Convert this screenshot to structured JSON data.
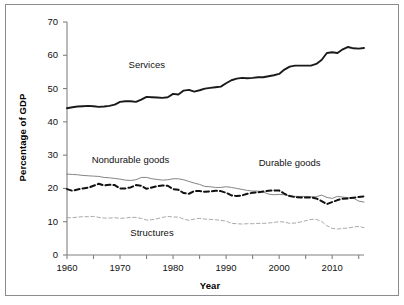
{
  "chart_data": {
    "type": "line",
    "title": "",
    "xlabel": "Year",
    "ylabel": "Percentage of GDP",
    "xlim": [
      1960,
      2016
    ],
    "ylim": [
      0,
      70
    ],
    "grid": false,
    "legend_position": "inline-annotations",
    "yticks": [
      0,
      10,
      20,
      30,
      40,
      50,
      60,
      70
    ],
    "ytick_labels": [
      "0",
      "10",
      "20",
      "30",
      "40",
      "50",
      "60",
      "70"
    ],
    "xticks": [
      1960,
      1965,
      1970,
      1975,
      1980,
      1985,
      1990,
      1995,
      2000,
      2005,
      2010,
      2015
    ],
    "xtick_labels_major": [
      "1960",
      "1970",
      "1980",
      "1990",
      "2000",
      "2010"
    ],
    "xtick_major_values": [
      1960,
      1970,
      1980,
      1990,
      2000,
      2010
    ],
    "x": [
      1960,
      1961,
      1962,
      1963,
      1964,
      1965,
      1966,
      1967,
      1968,
      1969,
      1970,
      1971,
      1972,
      1973,
      1974,
      1975,
      1976,
      1977,
      1978,
      1979,
      1980,
      1981,
      1982,
      1983,
      1984,
      1985,
      1986,
      1987,
      1988,
      1989,
      1990,
      1991,
      1992,
      1993,
      1994,
      1995,
      1996,
      1997,
      1998,
      1999,
      2000,
      2001,
      2002,
      2003,
      2004,
      2005,
      2006,
      2007,
      2008,
      2009,
      2010,
      2011,
      2012,
      2013,
      2014,
      2015,
      2016
    ],
    "series": [
      {
        "name": "Services",
        "style": "solid-thick",
        "color": "#1a1a1a",
        "label_x": 1975,
        "label_y": 57,
        "values": [
          44.1,
          44.4,
          44.6,
          44.7,
          44.8,
          44.7,
          44.5,
          44.6,
          44.8,
          45.2,
          46.0,
          46.2,
          46.2,
          46.0,
          46.7,
          47.5,
          47.4,
          47.3,
          47.2,
          47.4,
          48.4,
          48.2,
          49.4,
          49.6,
          49.1,
          49.5,
          50.0,
          50.2,
          50.4,
          50.6,
          51.6,
          52.5,
          53.0,
          53.2,
          53.1,
          53.2,
          53.4,
          53.4,
          53.7,
          54.0,
          54.4,
          55.7,
          56.6,
          56.9,
          56.9,
          56.9,
          56.9,
          57.4,
          58.6,
          60.7,
          60.9,
          60.7,
          61.8,
          62.5,
          62.1,
          62.0,
          62.2
        ]
      },
      {
        "name": "Nondurable goods",
        "style": "solid-thin",
        "color": "#6e6e6e",
        "label_x": 1972,
        "label_y": 28.5,
        "values": [
          24.3,
          24.2,
          24.1,
          23.9,
          23.8,
          23.7,
          23.6,
          23.3,
          23.2,
          23.0,
          22.8,
          22.5,
          22.4,
          22.6,
          23.3,
          23.3,
          22.9,
          22.7,
          22.5,
          22.6,
          22.9,
          22.9,
          22.6,
          22.1,
          21.6,
          21.2,
          20.6,
          20.5,
          20.3,
          20.3,
          20.5,
          20.3,
          20.0,
          19.7,
          19.4,
          19.2,
          19.2,
          18.9,
          18.3,
          18.1,
          18.2,
          18.1,
          17.7,
          17.6,
          17.6,
          17.6,
          17.5,
          17.5,
          18.0,
          17.3,
          17.0,
          17.6,
          17.4,
          17.2,
          17.1,
          16.2,
          15.9
        ]
      },
      {
        "name": "Durable goods",
        "style": "dashed-thick",
        "color": "#111111",
        "label_x": 2002,
        "label_y": 27.5,
        "values": [
          19.8,
          19.3,
          19.7,
          20.0,
          20.2,
          20.8,
          21.4,
          20.9,
          21.1,
          21.0,
          20.0,
          20.0,
          20.3,
          21.0,
          20.8,
          19.9,
          20.3,
          20.7,
          20.9,
          20.8,
          19.8,
          19.6,
          18.6,
          18.4,
          19.2,
          19.2,
          19.0,
          19.1,
          19.3,
          19.2,
          18.7,
          17.9,
          17.7,
          17.9,
          18.4,
          18.7,
          18.8,
          19.1,
          19.3,
          19.4,
          19.4,
          18.4,
          17.7,
          17.4,
          17.3,
          17.3,
          17.3,
          17.0,
          16.2,
          15.3,
          15.9,
          16.5,
          16.9,
          17.0,
          17.2,
          17.4,
          17.6
        ]
      },
      {
        "name": "Structures",
        "style": "dashed-thin",
        "color": "#9a9a9a",
        "label_x": 1976,
        "label_y": 6.5,
        "values": [
          11.2,
          11.2,
          11.4,
          11.5,
          11.5,
          11.6,
          11.3,
          11.1,
          11.1,
          11.2,
          11.0,
          11.1,
          11.3,
          11.3,
          11.0,
          10.5,
          10.6,
          10.9,
          11.3,
          11.6,
          11.4,
          11.4,
          10.8,
          10.4,
          10.8,
          11.0,
          10.8,
          10.7,
          10.6,
          10.4,
          10.2,
          9.5,
          9.4,
          9.3,
          9.4,
          9.4,
          9.5,
          9.5,
          9.6,
          9.8,
          10.0,
          9.9,
          9.5,
          9.6,
          9.9,
          10.3,
          10.7,
          10.7,
          10.1,
          8.8,
          8.0,
          7.8,
          8.0,
          8.1,
          8.4,
          8.6,
          8.2
        ]
      }
    ]
  },
  "axes": {
    "y_title": "Percentage of GDP",
    "x_title": "Year"
  },
  "labels": {
    "services": "Services",
    "nondurable": "Nondurable goods",
    "durable": "Durable goods",
    "structures": "Structures"
  }
}
